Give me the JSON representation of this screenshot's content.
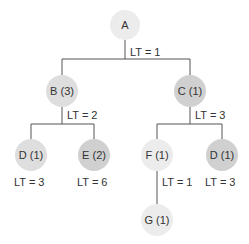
{
  "diagram": {
    "type": "tree",
    "colors": {
      "light": "#ececec",
      "medium": "#dedede",
      "dark": "#d0d0d0",
      "line": "#555555",
      "text": "#333333"
    },
    "nodes": [
      {
        "id": "A",
        "label": "A",
        "cx": 125,
        "cy": 25,
        "r": 15,
        "shade": "light"
      },
      {
        "id": "B",
        "label": "B (3)",
        "cx": 62,
        "cy": 91,
        "r": 16,
        "shade": "medium"
      },
      {
        "id": "C",
        "label": "C (1)",
        "cx": 190,
        "cy": 91,
        "r": 16,
        "shade": "dark"
      },
      {
        "id": "D1",
        "label": "D (1)",
        "cx": 31,
        "cy": 155,
        "r": 16,
        "shade": "medium"
      },
      {
        "id": "E",
        "label": "E (2)",
        "cx": 94,
        "cy": 155,
        "r": 16,
        "shade": "dark"
      },
      {
        "id": "F",
        "label": "F (1)",
        "cx": 157,
        "cy": 155,
        "r": 16,
        "shade": "light"
      },
      {
        "id": "D2",
        "label": "D (1)",
        "cx": 222,
        "cy": 155,
        "r": 16,
        "shade": "dark"
      },
      {
        "id": "G",
        "label": "G (1)",
        "cx": 157,
        "cy": 220,
        "r": 16,
        "shade": "light"
      }
    ],
    "lead_times": [
      {
        "node": "A",
        "label": "LT = 1",
        "x": 130,
        "y": 56
      },
      {
        "node": "B",
        "label": "LT = 2",
        "x": 67,
        "y": 119
      },
      {
        "node": "C",
        "label": "LT = 3",
        "x": 195,
        "y": 119
      },
      {
        "node": "D1",
        "label": "LT = 3",
        "x": 14,
        "y": 186
      },
      {
        "node": "E",
        "label": "LT = 6",
        "x": 77,
        "y": 186
      },
      {
        "node": "F",
        "label": "LT = 1",
        "x": 162,
        "y": 186
      },
      {
        "node": "D2",
        "label": "LT = 3",
        "x": 205,
        "y": 186
      }
    ]
  }
}
